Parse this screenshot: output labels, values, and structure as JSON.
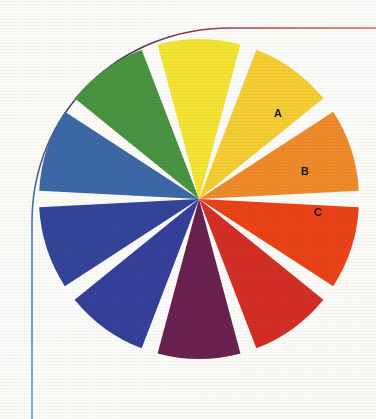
{
  "figure": {
    "center": {
      "x": 199,
      "y": 199
    },
    "inner_radius": 0,
    "outer_radius": 160,
    "gap_degrees": 6,
    "background_color": "#fdfdfb",
    "gap_color": "#ffffff"
  },
  "labels": [
    {
      "id": "A",
      "text": "A",
      "x": 278,
      "y": 113,
      "color": "#141414"
    },
    {
      "id": "B",
      "text": "B",
      "x": 305,
      "y": 171,
      "color": "#141414"
    },
    {
      "id": "C",
      "text": "C",
      "x": 318,
      "y": 212,
      "color": "#141414"
    }
  ],
  "decoration": {
    "curve": {
      "name": "corner-arc",
      "stroke_width": 1.6,
      "gradient_stops": [
        {
          "offset": 0,
          "color": "#5b9bd5"
        },
        {
          "offset": 0.22,
          "color": "#4f7fc4"
        },
        {
          "offset": 0.42,
          "color": "#4a3f72"
        },
        {
          "offset": 0.58,
          "color": "#46305a"
        },
        {
          "offset": 0.78,
          "color": "#9c4450"
        },
        {
          "offset": 1,
          "color": "#f4633a"
        }
      ]
    }
  },
  "chart_data": {
    "type": "pie",
    "xlabel": "",
    "ylabel": "",
    "legend": "none",
    "grid": false,
    "total_slices": 10,
    "each_slice_percent": 10,
    "categories": [
      "purple",
      "red-dark",
      "red-bright",
      "orange",
      "yellow-warm",
      "yellow-light",
      "green",
      "blue-steel",
      "blue-navy",
      "violet-blue"
    ],
    "values": [
      10,
      10,
      10,
      10,
      10,
      10,
      10,
      10,
      10,
      10
    ],
    "slices": [
      {
        "name": "purple",
        "label": "",
        "color": "#6b2150",
        "start_angle": 252,
        "end_angle": 288,
        "value": 10
      },
      {
        "name": "red-dark",
        "label": "A",
        "color": "#d52f26",
        "start_angle": 288,
        "end_angle": 324,
        "value": 10
      },
      {
        "name": "red-bright",
        "label": "B",
        "color": "#ec4318",
        "start_angle": 324,
        "end_angle": 360,
        "value": 10
      },
      {
        "name": "orange",
        "label": "C",
        "color": "#f08c2a",
        "start_angle": 0,
        "end_angle": 36,
        "value": 10
      },
      {
        "name": "yellow-warm",
        "label": "",
        "color": "#f6cf33",
        "start_angle": 36,
        "end_angle": 72,
        "value": 10
      },
      {
        "name": "yellow-light",
        "label": "",
        "color": "#f5e534",
        "start_angle": 72,
        "end_angle": 108,
        "value": 10
      },
      {
        "name": "green",
        "label": "",
        "color": "#4a9541",
        "start_angle": 108,
        "end_angle": 144,
        "value": 10
      },
      {
        "name": "blue-steel",
        "label": "",
        "color": "#3d69a8",
        "start_angle": 144,
        "end_angle": 180,
        "value": 10
      },
      {
        "name": "blue-navy",
        "label": "",
        "color": "#34459a",
        "start_angle": 180,
        "end_angle": 216,
        "value": 10
      },
      {
        "name": "violet-blue",
        "label": "",
        "color": "#36409b",
        "start_angle": 216,
        "end_angle": 252,
        "value": 10
      }
    ]
  }
}
